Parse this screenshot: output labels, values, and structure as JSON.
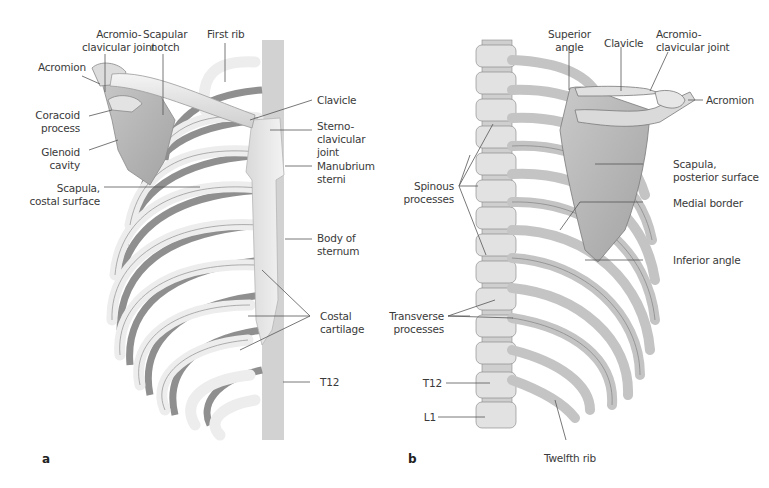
{
  "figure": {
    "panels": [
      {
        "id": "a",
        "letter": "a",
        "view": "anterior thorax with scapula",
        "labels": {
          "acromioclavicular_joint": "Acromio-\nclavicular joint",
          "scapular_notch": "Scapular\nnotch",
          "first_rib": "First rib",
          "acromion": "Acromion",
          "coracoid_process": "Coracoid\nprocess",
          "glenoid_cavity": "Glenoid\ncavity",
          "scapula_costal_surface": "Scapula,\ncostal surface",
          "clavicle": "Clavicle",
          "sternoclavicular_joint": "Sterno-\nclavicular\njoint",
          "manubrium_sterni": "Manubrium\nsterni",
          "body_of_sternum": "Body of\nsternum",
          "costal_cartilage": "Costal\ncartilage",
          "t12": "T12"
        }
      },
      {
        "id": "b",
        "letter": "b",
        "view": "posterior thorax with scapula",
        "labels": {
          "superior_angle": "Superior\nangle",
          "clavicle": "Clavicle",
          "acromioclavicular_joint": "Acromio-\nclavicular joint",
          "acromion": "Acromion",
          "spinous_processes": "Spinous\nprocesses",
          "scapula_posterior_surface": "Scapula,\nposterior surface",
          "medial_border": "Medial border",
          "inferior_angle": "Inferior angle",
          "transverse_processes": "Transverse\nprocesses",
          "t12": "T12",
          "l1": "L1",
          "twelfth_rib": "Twelfth rib"
        }
      }
    ],
    "colors": {
      "bone_light": "#e9e9e9",
      "bone_mid": "#c8c8c8",
      "bone_dark": "#8a8a8a",
      "label_text": "#3a3a3a",
      "leader_line": "#555555"
    }
  }
}
